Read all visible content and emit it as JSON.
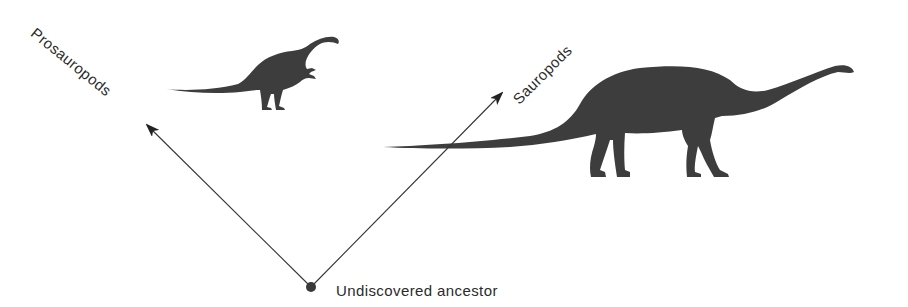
{
  "diagram": {
    "title": "",
    "colors": {
      "background": "#ffffff",
      "silhouette": "#3d3d3d",
      "line": "#333333",
      "text": "#2b2b2b"
    },
    "root": {
      "id": "ancestor",
      "label": "Undiscovered ancestor",
      "x": 311,
      "y": 287
    },
    "branches": [
      {
        "id": "prosauropods",
        "label": "Prosauropods",
        "from": [
          311,
          287
        ],
        "to": [
          147,
          125
        ],
        "icon": "prosauropod-silhouette-icon"
      },
      {
        "id": "sauropods",
        "label": "Sauropods",
        "from": [
          311,
          287
        ],
        "to": [
          502,
          93
        ],
        "icon": "sauropod-silhouette-icon"
      }
    ]
  }
}
